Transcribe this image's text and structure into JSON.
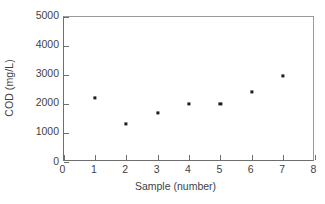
{
  "chart_data": {
    "type": "scatter",
    "title": "",
    "xlabel": "Sample (number)",
    "ylabel": "COD (mg/L)",
    "x": [
      1,
      2,
      3,
      4,
      5,
      6,
      7
    ],
    "values": [
      2200,
      1300,
      1700,
      2000,
      2000,
      2400,
      2950
    ],
    "series": [
      {
        "name": "COD",
        "points": [
          {
            "x": 1,
            "y": 2200
          },
          {
            "x": 2,
            "y": 1300
          },
          {
            "x": 3,
            "y": 1700
          },
          {
            "x": 4,
            "y": 2000
          },
          {
            "x": 5,
            "y": 2000
          },
          {
            "x": 6,
            "y": 2400
          },
          {
            "x": 7,
            "y": 2950
          }
        ]
      }
    ],
    "xlim": [
      0,
      8
    ],
    "ylim": [
      0,
      5000
    ],
    "xticks": [
      0,
      1,
      2,
      3,
      4,
      5,
      6,
      7,
      8
    ],
    "yticks": [
      0,
      1000,
      2000,
      3000,
      4000,
      5000
    ],
    "xtick_labels": [
      "0",
      "1",
      "2",
      "3",
      "4",
      "5",
      "6",
      "7",
      "8"
    ],
    "ytick_labels": [
      "0",
      "1000",
      "2000",
      "3000",
      "4000",
      "5000"
    ],
    "grid": false,
    "legend": null,
    "marker": "square",
    "marker_color": "#1c1c1c",
    "axis_color": "#6e6e6e"
  }
}
